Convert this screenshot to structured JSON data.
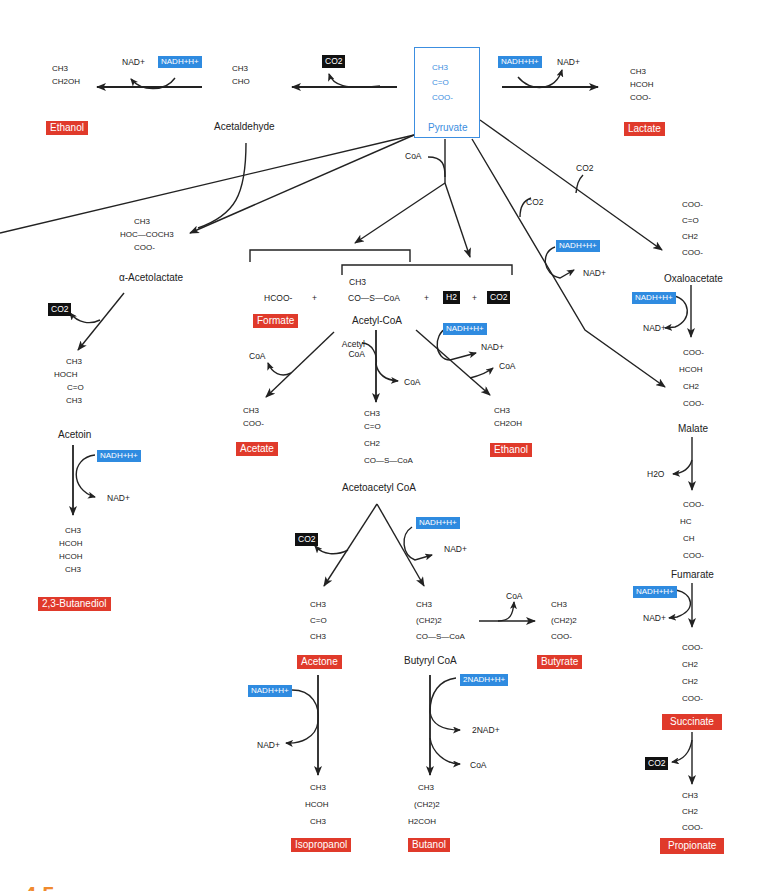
{
  "diagram": {
    "type": "metabolic-pathway",
    "figure_label": "4.5"
  },
  "colors": {
    "product_label_bg": "#e03a2b",
    "nadh_label_bg": "#2f8be0",
    "gas_label_bg": "#111111",
    "pyruvate_accent": "#3c8ee0",
    "figure_number": "#f08a2e"
  },
  "pyruvate": {
    "name": "Pyruvate",
    "structure": [
      "CH3",
      "C=O",
      "COO-"
    ]
  },
  "top_row": {
    "ethanol_struct": [
      "CH3",
      "CH2OH"
    ],
    "ethanol_label": "Ethanol",
    "ethanol_step": {
      "out": "NAD+",
      "in": "NADH+H+"
    },
    "acetaldehyde_struct": [
      "CH3",
      "CHO"
    ],
    "acetaldehyde_name": "Acetaldehyde",
    "decarb_gas": "CO2",
    "lactate_step": {
      "in": "NADH+H+",
      "out": "NAD+"
    },
    "lactate_struct": [
      "CH3",
      "HCOH",
      "COO-"
    ],
    "lactate_label": "Lactate"
  },
  "pyruvate_branches": {
    "coa_in": "CoA",
    "co2_in_1": "CO2",
    "co2_in_2": "CO2",
    "malate_step": {
      "in": "NADH+H+",
      "out": "NAD+"
    }
  },
  "butanediol_path": {
    "acetolactate_struct": [
      "CH3",
      "HOC—COCH3",
      "COO-"
    ],
    "acetolactate_name": "α-Acetolactate",
    "gas": "CO2",
    "acetoin_struct": [
      "CH3",
      "HOCH",
      "C=O",
      "CH3"
    ],
    "acetoin_name": "Acetoin",
    "step": {
      "in": "NADH+H+",
      "out": "NAD+"
    },
    "butanediol_struct": [
      "CH3",
      "HCOH",
      "HCOH",
      "CH3"
    ],
    "butanediol_label": "2,3-Butanediol"
  },
  "acetyl_coa_split": {
    "formate_struct": "HCOO-",
    "plus": "+",
    "acetyl_coa_struct_top": "CH3",
    "acetyl_coa_struct_bottom": "CO—S—CoA",
    "h2": "H2",
    "co2": "CO2",
    "formate_label": "Formate",
    "acetyl_coa_name": "Acetyl-CoA"
  },
  "acetyl_coa_products": {
    "acetate_out": "CoA",
    "acetate_struct": [
      "CH3",
      "COO-"
    ],
    "acetate_label": "Acetate",
    "condense_in": "Acetyl CoA",
    "condense_out": "CoA",
    "acetoacetyl_struct": [
      "CH3",
      "C=O",
      "CH2",
      "CO—S—CoA"
    ],
    "acetoacetyl_name": "Acetoacetyl CoA",
    "ethanol_step": {
      "in": "NADH+H+",
      "out1": "NAD+",
      "out2": "CoA"
    },
    "ethanol_struct": [
      "CH3",
      "CH2OH"
    ],
    "ethanol_label": "Ethanol"
  },
  "solvent_path": {
    "acetone_gas": "CO2",
    "butyryl_step": {
      "in": "NADH+H+",
      "out": "NAD+"
    },
    "acetone_struct": [
      "CH3",
      "C=O",
      "CH3"
    ],
    "acetone_label": "Acetone",
    "butyryl_struct": [
      "CH3",
      "(CH2)2",
      "CO—S—CoA"
    ],
    "butyryl_name": "Butyryl CoA",
    "butyrate_out": "CoA",
    "butyrate_struct": [
      "CH3",
      "(CH2)2",
      "COO-"
    ],
    "butyrate_label": "Butyrate",
    "isopropanol_step": {
      "in": "NADH+H+",
      "out": "NAD+"
    },
    "isopropanol_struct": [
      "CH3",
      "HCOH",
      "CH3"
    ],
    "isopropanol_label": "Isopropanol",
    "butanol_step": {
      "in": "2NADH+H+",
      "out1": "2NAD+",
      "out2": "CoA"
    },
    "butanol_struct": [
      "CH3",
      "(CH2)2",
      "H2COH"
    ],
    "butanol_label": "Butanol"
  },
  "succinate_path": {
    "oxaloacetate_struct": [
      "COO-",
      "C=O",
      "CH2",
      "COO-"
    ],
    "oxaloacetate_name": "Oxaloacetate",
    "oxalo_step": {
      "in": "NADH+H+",
      "out": "NAD+"
    },
    "malate_struct": [
      "COO-",
      "HCOH",
      "CH2",
      "COO-"
    ],
    "malate_name": "Malate",
    "water": "H2O",
    "fumarate_struct": [
      "COO-",
      "HC",
      "CH",
      "COO-"
    ],
    "fumarate_name": "Fumarate",
    "fumarate_step": {
      "in": "NADH+H+",
      "out": "NAD+"
    },
    "succinate_struct": [
      "COO-",
      "CH2",
      "CH2",
      "COO-"
    ],
    "succinate_label": "Succinate",
    "gas": "CO2",
    "propionate_struct": [
      "CH3",
      "CH2",
      "COO-"
    ],
    "propionate_label": "Propionate"
  }
}
